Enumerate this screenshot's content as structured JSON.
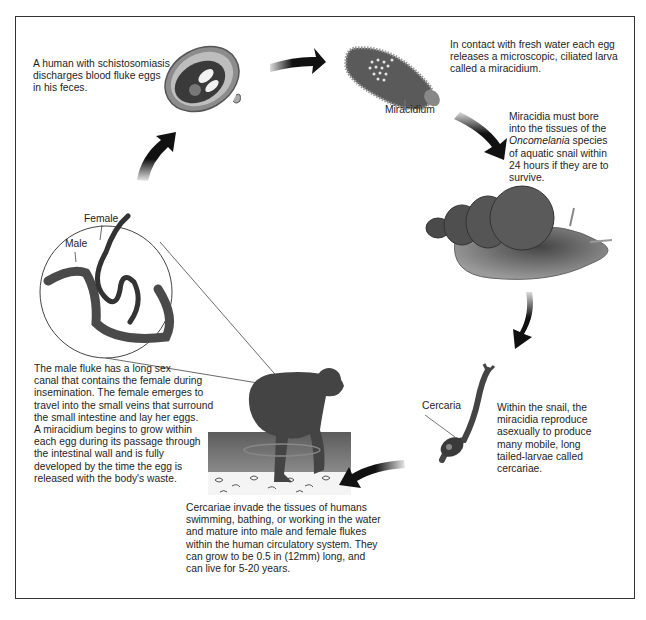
{
  "diagram": {
    "steps": [
      {
        "id": "eggs",
        "text": "A human with schistosomiasis discharges blood fluke eggs in his feces.",
        "lines": [
          "A human with schistosomiasis",
          "discharges blood fluke eggs",
          "in his feces."
        ]
      },
      {
        "id": "miracidium-release",
        "text": "In contact with fresh water each egg releases a microscopic, ciliated larva called a miracidium.",
        "lines": [
          "In contact with fresh water each egg",
          "releases a microscopic, ciliated larva",
          "called a miracidium."
        ]
      },
      {
        "id": "snail-infection",
        "text": "Miracidia must bore into the tissues of the Oncomelania species of aquatic snail within 24 hours if they are to survive.",
        "lines": [
          "Miracidia must bore",
          "into the tissues of the",
          "Oncomelania",
          " species",
          "of aquatic snail within",
          "24 hours if they are to",
          "survive."
        ]
      },
      {
        "id": "cercariae",
        "text": "Within the snail, the miracidia reproduce asexually to produce many mobile, long tailed-larvae called cercariae.",
        "lines": [
          "Within the snail, the",
          "miracidia reproduce",
          "asexually to produce",
          "many mobile, long",
          "tailed-larvae called",
          "cercariae."
        ]
      },
      {
        "id": "human-invasion",
        "text": "Cercariae invade the tissues of humans swimming, bathing, or working in the water and mature into male and female flukes within the human circulatory system. They can grow to be 0.5 in (12mm) long, and can live for 5-20 years.",
        "lines": [
          "Cercariae invade the tissues of humans",
          "swimming, bathing, or working in the water",
          "and mature into male and female flukes",
          "within the human circulatory system. They",
          "can grow to be 0.5 in (12mm) long, and",
          "can live for 5-20 years."
        ]
      },
      {
        "id": "fluke-mating",
        "text": "The male fluke has a long sex canal that contains the female during insemination. The female emerges to travel into the small veins that surround the small intestine and lay her eggs. A miracidium begins to grow within each egg during its passage through the intestinal wall and is fully developed by the time the egg is released with the body's waste.",
        "lines": [
          "The male fluke has a long sex",
          "canal that contains the female during",
          "insemination. The female emerges to",
          "travel into the small veins that surround",
          "the small intestine and lay her eggs.",
          "A miracidium begins to grow within",
          "each egg during its passage through",
          "the intestinal wall and is fully",
          "developed by the time the egg is",
          "released with the body's waste."
        ]
      }
    ],
    "labels": {
      "miracidium": "Miracidium",
      "cercaria": "Cercaria",
      "female": "Female",
      "male": "Male"
    },
    "illustrations": [
      "egg-icon",
      "miracidium-icon",
      "snail-icon",
      "cercaria-icon",
      "human-wading-icon",
      "fluke-pair-icon"
    ],
    "colors": {
      "frame": "#333333",
      "organism": "#555555",
      "organism_dark": "#3a3a3a",
      "water": "#6e6e6e",
      "arrow": "#111111"
    }
  }
}
